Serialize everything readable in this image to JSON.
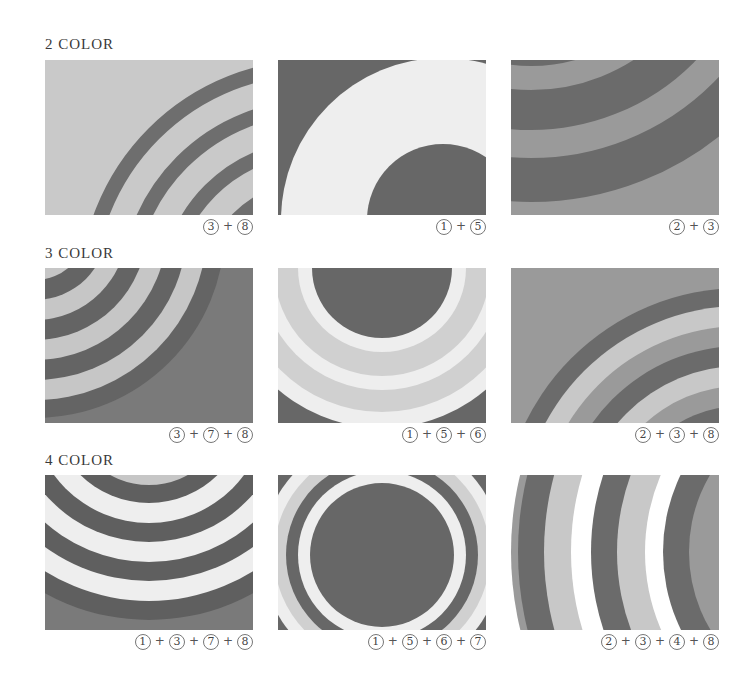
{
  "sections": [
    {
      "label": "2 COLOR"
    },
    {
      "label": "3 COLOR"
    },
    {
      "label": "4 COLOR"
    }
  ],
  "palette": {
    "1": "#eeeeee",
    "2": "#9a9a9a",
    "3": "#6b6b6b",
    "4": "#ffffff",
    "5": "#676767",
    "6": "#d0d0d0",
    "7": "#c6c6c6",
    "8": "#7a7a7a"
  },
  "panels": [
    {
      "caption": [
        "3",
        "8"
      ],
      "colors": {
        "bg": "#c9c9c9",
        "ring": "#6e6e6e"
      }
    },
    {
      "caption": [
        "1",
        "5"
      ],
      "colors": {
        "bg": "#676767",
        "ring": "#eeeeee"
      }
    },
    {
      "caption": [
        "2",
        "3"
      ],
      "colors": {
        "bg": "#9a9a9a",
        "ring": "#6b6b6b"
      }
    },
    {
      "caption": [
        "3",
        "7",
        "8"
      ],
      "colors": {
        "bg": "#7a7a7a",
        "dark": "#646464",
        "light": "#c6c6c6"
      }
    },
    {
      "caption": [
        "1",
        "5",
        "6"
      ],
      "colors": {
        "bg": "#676767",
        "white": "#eeeeee",
        "light": "#d0d0d0"
      }
    },
    {
      "caption": [
        "2",
        "3",
        "8"
      ],
      "colors": {
        "bg": "#9a9a9a",
        "dark": "#6b6b6b",
        "light": "#c8c8c8"
      }
    },
    {
      "caption": [
        "1",
        "3",
        "7",
        "8"
      ],
      "colors": {
        "bg": "#7a7a7a",
        "dark": "#5f5f5f",
        "white": "#eeeeee",
        "light": "#c6c6c6"
      }
    },
    {
      "caption": [
        "1",
        "5",
        "6",
        "7"
      ],
      "colors": {
        "bg": "#eeeeee",
        "dark": "#676767",
        "light": "#d0d0d0",
        "mid": "#c6c6c6"
      }
    },
    {
      "caption": [
        "2",
        "3",
        "4",
        "8"
      ],
      "colors": {
        "bg": "#9a9a9a",
        "dark": "#6b6b6b",
        "white": "#ffffff",
        "light": "#c8c8c8"
      }
    }
  ],
  "plus_sign": "+"
}
